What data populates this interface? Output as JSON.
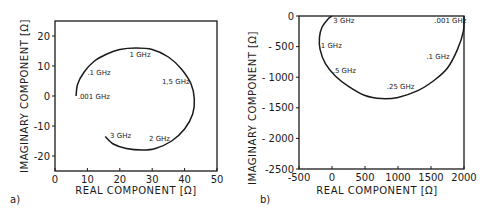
{
  "chart_data": [
    {
      "panel_label": "a)",
      "type": "line",
      "title": "",
      "xlabel": "REAL COMPONENT [Ω]",
      "ylabel": "IMAGINARY COMPONENT [Ω]",
      "xlim": [
        0,
        50
      ],
      "ylim": [
        -25,
        25
      ],
      "xticks": [
        "0",
        "10",
        "20",
        "30",
        "40",
        "50"
      ],
      "yticks": [
        "20",
        "10",
        "0",
        "-10",
        "-20"
      ],
      "grid": false,
      "legend": null,
      "series": [
        {
          "name": "impedance locus",
          "x": [
            6.5,
            7,
            9,
            12,
            16,
            20,
            25,
            30,
            35,
            39,
            42,
            43,
            42.5,
            40,
            36,
            31,
            27,
            22,
            18,
            15.5
          ],
          "y": [
            0,
            4,
            8,
            11.5,
            14,
            15.5,
            16,
            15.5,
            13,
            9,
            4,
            -1,
            -6,
            -11,
            -15,
            -17.5,
            -18,
            -17.5,
            -16,
            -13.5
          ]
        }
      ],
      "annotations": [
        {
          "text": ".001 GHz",
          "x": 7,
          "y": 0
        },
        {
          "text": ".1 GHz",
          "x": 10,
          "y": 8
        },
        {
          "text": "1 GHz",
          "x": 23,
          "y": 14
        },
        {
          "text": "1,5 GHz",
          "x": 33,
          "y": 5
        },
        {
          "text": "2 GHz",
          "x": 29,
          "y": -14
        },
        {
          "text": "3 GHz",
          "x": 17,
          "y": -13
        }
      ]
    },
    {
      "panel_label": "b)",
      "type": "line",
      "title": "",
      "xlabel": "REAL COMPONENT [Ω]",
      "ylabel": "IMAGINARY COMPONENT [Ω]",
      "xlim": [
        -500,
        2000
      ],
      "ylim": [
        -2500,
        0
      ],
      "xticks": [
        "-500",
        "0",
        "500",
        "1000",
        "1500",
        "2000"
      ],
      "yticks": [
        "0",
        "- 500",
        "- 1000",
        "- 1500",
        "- 2000",
        "-2500"
      ],
      "grid": false,
      "legend": null,
      "series": [
        {
          "name": "impedance locus",
          "x": [
            2000,
            1990,
            1900,
            1750,
            1550,
            1300,
            1000,
            750,
            500,
            250,
            50,
            -100,
            -180,
            -190,
            -150,
            -60,
            0
          ],
          "y": [
            0,
            -250,
            -550,
            -850,
            -1050,
            -1220,
            -1330,
            -1350,
            -1300,
            -1150,
            -980,
            -780,
            -550,
            -350,
            -180,
            -50,
            0
          ]
        }
      ],
      "annotations": [
        {
          "text": "3 GHz",
          "x": 20,
          "y": -60
        },
        {
          "text": ".001 GHz",
          "x": 1550,
          "y": -60
        },
        {
          "text": "1 GHz",
          "x": -170,
          "y": -480
        },
        {
          "text": ".1 GHz",
          "x": 1430,
          "y": -650
        },
        {
          "text": ".5 GHz",
          "x": 10,
          "y": -880
        },
        {
          "text": ".25 GHz",
          "x": 830,
          "y": -1150
        }
      ]
    }
  ]
}
